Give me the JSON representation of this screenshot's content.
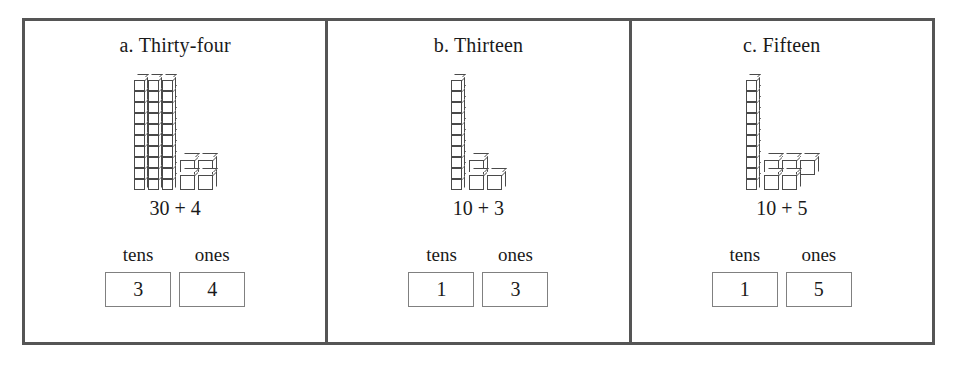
{
  "worksheet": {
    "border_color": "#555555",
    "box_border_color": "#808080",
    "cube_line_color": "#4a4a4a",
    "panels": [
      {
        "title": "a. Thirty-four",
        "equation": "30 + 4",
        "tens_label": "tens",
        "ones_label": "ones",
        "tens_value": "3",
        "ones_value": "4",
        "rods": 3,
        "cubes_per_rod": 10,
        "loose_cubes": 4,
        "loose_layout": [
          2,
          2
        ],
        "loose_align": "left",
        "number_value": 34
      },
      {
        "title": "b. Thirteen",
        "equation": "10 + 3",
        "tens_label": "tens",
        "ones_label": "ones",
        "tens_value": "1",
        "ones_value": "3",
        "rods": 1,
        "cubes_per_rod": 10,
        "loose_cubes": 3,
        "loose_layout": [
          1,
          2
        ],
        "loose_align": "left",
        "number_value": 13
      },
      {
        "title": "c. Fifteen",
        "equation": "10 + 5",
        "tens_label": "tens",
        "ones_label": "ones",
        "tens_value": "1",
        "ones_value": "5",
        "rods": 1,
        "cubes_per_rod": 10,
        "loose_cubes": 5,
        "loose_layout": [
          3,
          2
        ],
        "loose_align": "left",
        "number_value": 15
      }
    ]
  }
}
